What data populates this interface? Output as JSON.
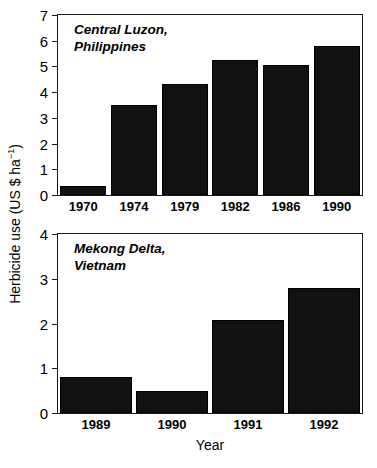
{
  "axis": {
    "ylabel_main": "Herbicide use (US $ ha",
    "ylabel_sup": "−1",
    "ylabel_close": ")",
    "ylabel_full": "Herbicide use (US $ ha−1)",
    "xlabel": "Year"
  },
  "chart_data": [
    {
      "type": "bar",
      "panel": "top",
      "annotation": "Central Luzon,\nPhilippines",
      "categories": [
        "1970",
        "1974",
        "1979",
        "1982",
        "1986",
        "1990"
      ],
      "values": [
        0.35,
        3.5,
        4.3,
        5.25,
        5.05,
        5.8
      ],
      "title": "",
      "xlabel": "",
      "ylabel": "Herbicide use (US $ ha−1)",
      "ylim": [
        0,
        7
      ],
      "yticks": [
        0,
        1,
        2,
        3,
        4,
        5,
        6,
        7
      ],
      "ytick_labels": [
        "0",
        "1",
        "2",
        "3",
        "4",
        "5",
        "6",
        "7"
      ],
      "grid": false,
      "legend": "none",
      "bar_color": "#111111"
    },
    {
      "type": "bar",
      "panel": "bottom",
      "annotation": "Mekong Delta,\nVietnam",
      "categories": [
        "1989",
        "1990",
        "1991",
        "1992"
      ],
      "values": [
        0.8,
        0.5,
        2.07,
        2.8
      ],
      "title": "",
      "xlabel": "Year",
      "ylabel": "Herbicide use (US $ ha−1)",
      "ylim": [
        0,
        4
      ],
      "yticks": [
        0,
        1,
        2,
        3,
        4
      ],
      "ytick_labels": [
        "0",
        "1",
        "2",
        "3",
        "4"
      ],
      "grid": false,
      "legend": "none",
      "bar_color": "#111111"
    }
  ]
}
